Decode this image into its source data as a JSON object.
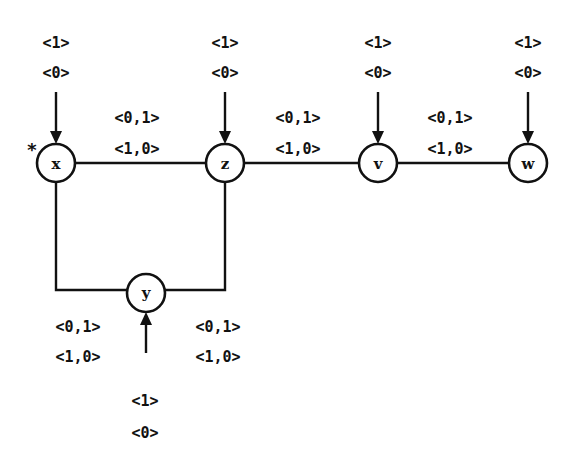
{
  "diagram": {
    "type": "graph",
    "nodes": [
      {
        "id": "x",
        "label": "x",
        "cx": 56,
        "cy": 163,
        "marked": true,
        "mark": "*",
        "input_labels": [
          "<1>",
          "<0>"
        ],
        "input_dir": "from-top"
      },
      {
        "id": "z",
        "label": "z",
        "cx": 225,
        "cy": 163,
        "input_labels": [
          "<1>",
          "<0>"
        ],
        "input_dir": "from-top"
      },
      {
        "id": "v",
        "label": "v",
        "cx": 378,
        "cy": 163,
        "input_labels": [
          "<1>",
          "<0>"
        ],
        "input_dir": "from-top"
      },
      {
        "id": "w",
        "label": "w",
        "cx": 528,
        "cy": 163,
        "input_labels": [
          "<1>",
          "<0>"
        ],
        "input_dir": "from-top"
      },
      {
        "id": "y",
        "label": "y",
        "cx": 146,
        "cy": 293,
        "input_labels": [
          "<1>",
          "<0>"
        ],
        "input_dir": "from-bottom"
      }
    ],
    "edges": [
      {
        "from": "x",
        "to": "z",
        "labels": [
          "<0,1>",
          "<1,0>"
        ]
      },
      {
        "from": "z",
        "to": "v",
        "labels": [
          "<0,1>",
          "<1,0>"
        ]
      },
      {
        "from": "v",
        "to": "w",
        "labels": [
          "<0,1>",
          "<1,0>"
        ]
      },
      {
        "from": "x",
        "to": "y",
        "labels": [
          "<0,1>",
          "<1,0>"
        ]
      },
      {
        "from": "z",
        "to": "y",
        "labels": [
          "<0,1>",
          "<1,0>"
        ]
      }
    ]
  },
  "labels": {
    "x_mark": "*",
    "x_name": "x",
    "z_name": "z",
    "v_name": "v",
    "w_name": "w",
    "y_name": "y",
    "x_in_top": "<1>",
    "x_in_bot": "<0>",
    "z_in_top": "<1>",
    "z_in_bot": "<0>",
    "v_in_top": "<1>",
    "v_in_bot": "<0>",
    "w_in_top": "<1>",
    "w_in_bot": "<0>",
    "y_in_top": "<1>",
    "y_in_bot": "<0>",
    "xz_top": "<0,1>",
    "xz_bot": "<1,0>",
    "zv_top": "<0,1>",
    "zv_bot": "<1,0>",
    "vw_top": "<0,1>",
    "vw_bot": "<1,0>",
    "xy_top": "<0,1>",
    "xy_bot": "<1,0>",
    "zy_top": "<0,1>",
    "zy_bot": "<1,0>"
  },
  "colors": {
    "ink": "#111111",
    "background": "#ffffff"
  }
}
